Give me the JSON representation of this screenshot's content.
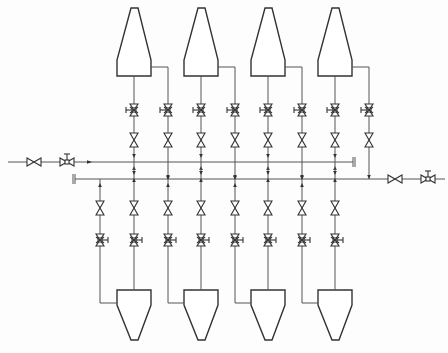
{
  "diagram": {
    "type": "process-flow-diagram",
    "colors": {
      "line": "#555555",
      "equipment": "#333333",
      "background": "#fdfdfd"
    },
    "headers": [
      {
        "id": "upper-header",
        "y": 162,
        "x_start": 88,
        "x_end": 353,
        "end": "blind-cap",
        "inlet": "left",
        "inlet_valves": [
          "gate-valve",
          "control-valve"
        ]
      },
      {
        "id": "lower-header",
        "y": 179,
        "x_start": 75,
        "x_end": 445,
        "start": "blind-cap",
        "outlet": "right",
        "outlet_valves": [
          "gate-valve",
          "control-valve"
        ]
      }
    ],
    "upper_cyclones": [
      {
        "id": "U1",
        "cx": 134,
        "outlet_x": 134,
        "side_outlet_x": 168
      },
      {
        "id": "U2",
        "cx": 201,
        "outlet_x": 201,
        "side_outlet_x": 235
      },
      {
        "id": "U3",
        "cx": 268,
        "outlet_x": 268,
        "side_outlet_x": 302
      },
      {
        "id": "U4",
        "cx": 335,
        "outlet_x": 335,
        "side_outlet_x": 369
      }
    ],
    "lower_cyclones": [
      {
        "id": "L1",
        "cx": 134,
        "inlet_x": 100,
        "top_x": 134
      },
      {
        "id": "L2",
        "cx": 201,
        "inlet_x": 168,
        "top_x": 201
      },
      {
        "id": "L3",
        "cx": 268,
        "inlet_x": 235,
        "top_x": 268
      },
      {
        "id": "L4",
        "cx": 335,
        "inlet_x": 302,
        "top_x": 335
      }
    ],
    "branch_valves_per_line": [
      "control-valve",
      "gate-valve"
    ]
  }
}
